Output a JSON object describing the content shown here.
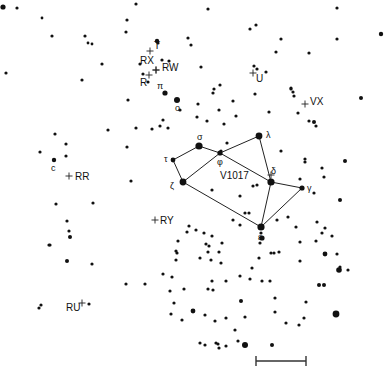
{
  "chart_data": {
    "type": "scatter",
    "title": "",
    "constellation_lines": [
      [
        "tau",
        "sigma"
      ],
      [
        "sigma",
        "phi"
      ],
      [
        "phi",
        "lambda"
      ],
      [
        "tau",
        "zeta"
      ],
      [
        "zeta",
        "phi"
      ],
      [
        "phi",
        "delta"
      ],
      [
        "lambda",
        "delta"
      ],
      [
        "delta",
        "gamma"
      ],
      [
        "delta",
        "epsilon"
      ],
      [
        "gamma",
        "epsilon"
      ],
      [
        "zeta",
        "epsilon"
      ]
    ],
    "named_stars": {
      "sigma": {
        "x": 199,
        "y": 146,
        "r": 3.6,
        "label": "σ"
      },
      "tau": {
        "x": 173,
        "y": 160,
        "r": 2.4,
        "label": "τ"
      },
      "phi": {
        "x": 220,
        "y": 153,
        "r": 2.6,
        "label": "φ"
      },
      "lambda": {
        "x": 259,
        "y": 136,
        "r": 3.4,
        "label": "λ"
      },
      "zeta": {
        "x": 183,
        "y": 182,
        "r": 3.4,
        "label": "ζ"
      },
      "delta": {
        "x": 271,
        "y": 182,
        "r": 3.6,
        "label": "δ"
      },
      "gamma": {
        "x": 302,
        "y": 188,
        "r": 2.6,
        "label": "γ"
      },
      "epsilon": {
        "x": 261,
        "y": 227,
        "r": 3.6,
        "label": "ε"
      },
      "pi": {
        "x": 165,
        "y": 93,
        "r": 2.6,
        "label": "π"
      },
      "omicron": {
        "x": 177,
        "y": 100,
        "r": 3.0,
        "label": "ο"
      },
      "c": {
        "x": 54,
        "y": 160,
        "r": 2.2,
        "label": "c"
      }
    },
    "variable_stars": [
      {
        "name": "T",
        "x": 150,
        "y": 51
      },
      {
        "name": "RX",
        "x": 156,
        "y": 70
      },
      {
        "name": "RW",
        "x": 156,
        "y": 70
      },
      {
        "name": "R",
        "x": 149,
        "y": 75
      },
      {
        "name": "U",
        "x": 253,
        "y": 73
      },
      {
        "name": "VX",
        "x": 305,
        "y": 104
      },
      {
        "name": "RR",
        "x": 69,
        "y": 176
      },
      {
        "name": "RY",
        "x": 155,
        "y": 220
      },
      {
        "name": "V1017",
        "x": 271,
        "y": 175
      },
      {
        "name": "RU",
        "x": 82,
        "y": 303
      }
    ],
    "field_stars": [
      [
        3,
        7,
        2.6
      ],
      [
        17,
        8,
        1.6
      ],
      [
        42,
        18,
        1.4
      ],
      [
        52,
        36,
        1.6
      ],
      [
        85,
        36,
        1.6
      ],
      [
        88,
        43,
        1.4
      ],
      [
        92,
        44,
        1.4
      ],
      [
        102,
        64,
        1.6
      ],
      [
        82,
        80,
        1.6
      ],
      [
        6,
        73,
        1.6
      ],
      [
        128,
        100,
        1.6
      ],
      [
        108,
        130,
        1.6
      ],
      [
        127,
        20,
        1.6
      ],
      [
        126,
        32,
        1.6
      ],
      [
        136,
        4,
        1.6
      ],
      [
        157,
        41,
        2.2
      ],
      [
        162,
        60,
        1.6
      ],
      [
        169,
        61,
        1.6
      ],
      [
        158,
        43,
        1.6
      ],
      [
        188,
        38,
        1.6
      ],
      [
        191,
        45,
        1.6
      ],
      [
        208,
        9,
        1.6
      ],
      [
        201,
        67,
        1.6
      ],
      [
        214,
        89,
        1.6
      ],
      [
        213,
        93,
        1.6
      ],
      [
        220,
        85,
        1.6
      ],
      [
        233,
        101,
        1.6
      ],
      [
        219,
        110,
        1.6
      ],
      [
        236,
        116,
        1.6
      ],
      [
        198,
        104,
        1.6
      ],
      [
        197,
        117,
        1.6
      ],
      [
        207,
        121,
        1.6
      ],
      [
        224,
        124,
        1.6
      ],
      [
        168,
        128,
        1.6
      ],
      [
        163,
        120,
        1.6
      ],
      [
        180,
        110,
        1.6
      ],
      [
        143,
        74,
        1.6
      ],
      [
        140,
        64,
        1.6
      ],
      [
        148,
        82,
        1.6
      ],
      [
        256,
        25,
        1.6
      ],
      [
        250,
        29,
        1.6
      ],
      [
        254,
        66,
        1.6
      ],
      [
        257,
        69,
        1.6
      ],
      [
        281,
        39,
        1.6
      ],
      [
        276,
        52,
        1.6
      ],
      [
        309,
        53,
        1.6
      ],
      [
        337,
        8,
        1.6
      ],
      [
        381,
        34,
        2.2
      ],
      [
        337,
        39,
        1.6
      ],
      [
        361,
        98,
        2.0
      ],
      [
        291,
        88,
        1.6
      ],
      [
        291,
        89,
        1.6
      ],
      [
        293,
        92,
        1.6
      ],
      [
        294,
        96,
        1.6
      ],
      [
        298,
        113,
        1.6
      ],
      [
        314,
        122,
        2.0
      ],
      [
        309,
        121,
        1.6
      ],
      [
        316,
        126,
        1.6
      ],
      [
        255,
        94,
        1.6
      ],
      [
        266,
        72,
        1.6
      ],
      [
        269,
        112,
        1.6
      ],
      [
        322,
        168,
        1.6
      ],
      [
        324,
        177,
        1.6
      ],
      [
        345,
        161,
        2.0
      ],
      [
        305,
        162,
        1.6
      ],
      [
        300,
        179,
        1.6
      ],
      [
        340,
        200,
        2.0
      ],
      [
        325,
        228,
        1.6
      ],
      [
        322,
        233,
        1.6
      ],
      [
        281,
        151,
        1.6
      ],
      [
        253,
        186,
        1.6
      ],
      [
        257,
        185,
        1.6
      ],
      [
        245,
        213,
        1.6
      ],
      [
        249,
        213,
        1.6
      ],
      [
        233,
        220,
        1.6
      ],
      [
        212,
        190,
        1.6
      ],
      [
        240,
        196,
        1.6
      ],
      [
        222,
        243,
        1.6
      ],
      [
        221,
        151,
        1.6
      ],
      [
        227,
        143,
        1.6
      ],
      [
        189,
        226,
        1.6
      ],
      [
        206,
        244,
        1.6
      ],
      [
        40,
        152,
        1.6
      ],
      [
        55,
        134,
        1.6
      ],
      [
        66,
        156,
        1.6
      ],
      [
        66,
        144,
        1.6
      ],
      [
        127,
        147,
        1.6
      ],
      [
        160,
        126,
        1.6
      ],
      [
        152,
        129,
        1.6
      ],
      [
        136,
        128,
        1.6
      ],
      [
        131,
        181,
        1.6
      ],
      [
        56,
        204,
        1.6
      ],
      [
        93,
        203,
        1.6
      ],
      [
        67,
        221,
        1.6
      ],
      [
        69,
        231,
        1.6
      ],
      [
        70,
        237,
        2.0
      ],
      [
        50,
        245,
        1.6
      ],
      [
        67,
        261,
        2.0
      ],
      [
        92,
        264,
        1.6
      ],
      [
        49,
        245,
        1.6
      ],
      [
        126,
        284,
        1.6
      ],
      [
        145,
        284,
        1.6
      ],
      [
        89,
        304,
        1.6
      ],
      [
        41,
        305,
        1.6
      ],
      [
        39,
        308,
        1.6
      ],
      [
        170,
        291,
        1.6
      ],
      [
        177,
        253,
        1.6
      ],
      [
        176,
        251,
        1.6
      ],
      [
        176,
        260,
        1.6
      ],
      [
        184,
        289,
        1.6
      ],
      [
        182,
        320,
        1.6
      ],
      [
        163,
        274,
        1.6
      ],
      [
        172,
        277,
        1.6
      ],
      [
        171,
        314,
        1.6
      ],
      [
        193,
        311,
        2.4
      ],
      [
        174,
        303,
        1.6
      ],
      [
        196,
        230,
        1.6
      ],
      [
        178,
        241,
        1.6
      ],
      [
        187,
        232,
        1.6
      ],
      [
        208,
        252,
        1.6
      ],
      [
        204,
        233,
        1.6
      ],
      [
        212,
        236,
        1.6
      ],
      [
        209,
        246,
        1.6
      ],
      [
        211,
        260,
        1.6
      ],
      [
        221,
        263,
        1.6
      ],
      [
        240,
        225,
        1.6
      ],
      [
        261,
        233,
        1.6
      ],
      [
        219,
        252,
        1.6
      ],
      [
        200,
        258,
        1.6
      ],
      [
        252,
        268,
        1.6
      ],
      [
        262,
        238,
        2.6
      ],
      [
        260,
        243,
        1.6
      ],
      [
        240,
        276,
        1.6
      ],
      [
        250,
        279,
        1.6
      ],
      [
        262,
        281,
        1.6
      ],
      [
        212,
        281,
        1.6
      ],
      [
        226,
        281,
        1.6
      ],
      [
        208,
        289,
        1.6
      ],
      [
        213,
        290,
        1.6
      ],
      [
        241,
        301,
        2.0
      ],
      [
        235,
        330,
        1.6
      ],
      [
        238,
        341,
        1.6
      ],
      [
        205,
        315,
        1.6
      ],
      [
        226,
        318,
        1.6
      ],
      [
        215,
        321,
        1.6
      ],
      [
        200,
        343,
        1.6
      ],
      [
        216,
        343,
        1.6
      ],
      [
        218,
        344,
        1.6
      ],
      [
        259,
        258,
        1.6
      ],
      [
        274,
        253,
        1.6
      ],
      [
        279,
        252,
        1.6
      ],
      [
        271,
        253,
        1.6
      ],
      [
        270,
        281,
        1.6
      ],
      [
        300,
        261,
        1.6
      ],
      [
        325,
        254,
        2.4
      ],
      [
        337,
        254,
        1.6
      ],
      [
        339,
        270,
        2.8
      ],
      [
        340,
        267,
        1.6
      ],
      [
        348,
        270,
        1.6
      ],
      [
        319,
        285,
        2.0
      ],
      [
        324,
        285,
        2.0
      ],
      [
        306,
        302,
        1.6
      ],
      [
        275,
        298,
        1.6
      ],
      [
        275,
        312,
        1.6
      ],
      [
        304,
        318,
        1.6
      ],
      [
        336,
        314,
        3.4
      ],
      [
        245,
        317,
        1.6
      ],
      [
        286,
        323,
        1.6
      ],
      [
        299,
        325,
        1.6
      ],
      [
        205,
        345,
        1.6
      ],
      [
        245,
        345,
        3.0
      ],
      [
        272,
        345,
        2.0
      ],
      [
        219,
        348,
        1.6
      ],
      [
        226,
        346,
        1.6
      ],
      [
        300,
        242,
        1.6
      ],
      [
        316,
        241,
        1.6
      ],
      [
        332,
        236,
        1.6
      ],
      [
        296,
        227,
        1.6
      ],
      [
        288,
        217,
        1.6
      ],
      [
        277,
        220,
        1.6
      ],
      [
        317,
        222,
        1.6
      ],
      [
        314,
        193,
        1.6
      ],
      [
        305,
        159,
        1.6
      ]
    ],
    "scale_bar": {
      "x1": 256,
      "x2": 306,
      "y": 361,
      "tick_height": 10
    }
  },
  "labels": {
    "T": "T",
    "RX": "RX",
    "RW": "RW",
    "R": "R",
    "U": "U",
    "VX": "VX",
    "RR": "RR",
    "RY": "RY",
    "V1017": "V1017",
    "RU": "RU",
    "sigma": "σ",
    "tau": "τ",
    "phi": "φ",
    "lambda": "λ",
    "zeta": "ζ",
    "delta": "δ",
    "gamma": "γ",
    "epsilon": "ε",
    "pi": "π",
    "omicron": "ο",
    "c": "c"
  }
}
